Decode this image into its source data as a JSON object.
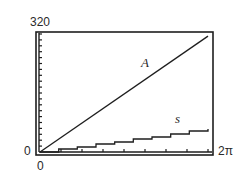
{
  "chart_data": {
    "type": "line",
    "title": "",
    "xlabel": "",
    "ylabel": "",
    "xlim": [
      0,
      6.2832
    ],
    "ylim": [
      0,
      320
    ],
    "x_tick_labels": [
      "0",
      "2π"
    ],
    "y_tick_labels": [
      "0",
      "320"
    ],
    "x_ticks_count": 8,
    "y_ticks_count": 20,
    "grid": false,
    "legend": "inline labels",
    "series": [
      {
        "name": "A",
        "x": [
          0,
          6.2832
        ],
        "values": [
          0,
          314.16
        ],
        "expression": "A = 50θ"
      },
      {
        "name": "s",
        "x": [
          0,
          6.2832
        ],
        "values": [
          0,
          62.83
        ],
        "expression": "s = 10θ"
      }
    ]
  },
  "labels": {
    "y_max": "320",
    "y_min": "0",
    "x_min": "0",
    "x_max": "2π",
    "series_a": "A",
    "series_s": "s"
  },
  "colors": {
    "line": "#1e1e1e",
    "frame": "#1e1e1e",
    "background": "#ffffff"
  }
}
